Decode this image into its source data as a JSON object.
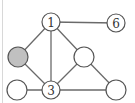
{
  "diagram": {
    "type": "graph",
    "colors": {
      "edge": "#6a6a6a",
      "node_stroke": "#555555",
      "node_fill": "#ffffff",
      "highlight_fill": "#c0c0c0"
    },
    "nodes": [
      {
        "id": "n1",
        "label": "1",
        "x": 51,
        "y": 22,
        "r": 9,
        "highlighted": false
      },
      {
        "id": "n6",
        "label": "6",
        "x": 116,
        "y": 23,
        "r": 9,
        "highlighted": false
      },
      {
        "id": "nGrey",
        "label": "",
        "x": 18,
        "y": 57,
        "r": 10,
        "highlighted": true
      },
      {
        "id": "nMid",
        "label": "",
        "x": 84,
        "y": 57,
        "r": 10,
        "highlighted": false
      },
      {
        "id": "nBL",
        "label": "",
        "x": 17,
        "y": 90,
        "r": 10,
        "highlighted": false
      },
      {
        "id": "n3",
        "label": "3",
        "x": 51,
        "y": 90,
        "r": 9,
        "highlighted": false
      },
      {
        "id": "nBR",
        "label": "",
        "x": 116,
        "y": 90,
        "r": 10,
        "highlighted": false
      }
    ],
    "edges": [
      [
        "n1",
        "n6"
      ],
      [
        "n1",
        "nGrey"
      ],
      [
        "n1",
        "n3"
      ],
      [
        "n1",
        "nMid"
      ],
      [
        "nGrey",
        "n3"
      ],
      [
        "nBL",
        "n3"
      ],
      [
        "n3",
        "nMid"
      ],
      [
        "n3",
        "nBR"
      ],
      [
        "nMid",
        "nBR"
      ]
    ]
  }
}
